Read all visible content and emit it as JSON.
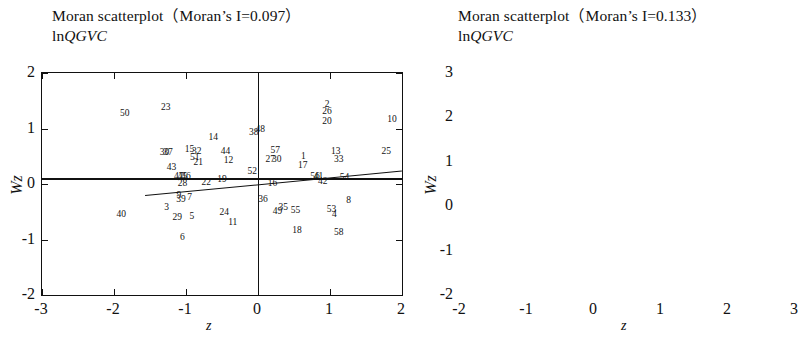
{
  "figure": {
    "kind": "moran-scatterplot-pair",
    "background": "#ffffff",
    "ink": "#111111"
  },
  "panels": [
    {
      "id": "left",
      "title_main": "Moran scatterplot（Moran’s I=0.097）",
      "title_var_prefix": "ln",
      "title_var_italic": "QGVC",
      "xlabel": "z",
      "ylabel": "Wz",
      "xticks": [
        "-3",
        "-2",
        "-1",
        "0",
        "1",
        "2"
      ],
      "yticks": [
        "2",
        "1",
        "0",
        "-1",
        "-2"
      ],
      "xlim": [
        -3,
        2
      ],
      "ylim": [
        -2,
        2
      ]
    },
    {
      "id": "right",
      "title_main": "Moran scatterplot（Moran’s I=0.133）",
      "title_var_prefix": "ln",
      "title_var_italic": "QGVC",
      "xlabel": "z",
      "ylabel": "Wz",
      "xticks": [
        "-2",
        "-1",
        "0",
        "1",
        "2",
        "3"
      ],
      "yticks": [
        "3",
        "2",
        "1",
        "0",
        "-1",
        "-2"
      ],
      "xlim": [
        -2,
        3
      ],
      "ylim": [
        -2,
        3
      ]
    }
  ],
  "chart_data": [
    {
      "type": "scatter",
      "title": "Moran scatterplot（Moran’s I=0.097） lnQGVC",
      "subtitle": "lnQGVC",
      "xlabel": "z",
      "ylabel": "Wz",
      "xlim": [
        -3,
        2
      ],
      "ylim": [
        -2,
        2
      ],
      "grid": false,
      "legend": null,
      "morans_i": 0.097,
      "reference_lines": {
        "vertical_x": 0,
        "horizontal_y": 0.1
      },
      "regression_line": {
        "x_start": -1.57,
        "y_start": -0.2,
        "x_end": 2.0,
        "y_end": 0.24
      },
      "point_label_field": "label",
      "points": [
        {
          "label": "50",
          "x": -1.85,
          "y": 1.26
        },
        {
          "label": "23",
          "x": -1.28,
          "y": 1.37
        },
        {
          "label": "2",
          "x": 0.96,
          "y": 1.42
        },
        {
          "label": "26",
          "x": 0.96,
          "y": 1.3
        },
        {
          "label": "20",
          "x": 0.96,
          "y": 1.12
        },
        {
          "label": "10",
          "x": 1.86,
          "y": 1.15
        },
        {
          "label": "14",
          "x": -0.62,
          "y": 0.82
        },
        {
          "label": "38",
          "x": -0.06,
          "y": 0.92
        },
        {
          "label": "48",
          "x": 0.03,
          "y": 0.97
        },
        {
          "label": "15",
          "x": -0.95,
          "y": 0.62
        },
        {
          "label": "32",
          "x": -0.85,
          "y": 0.58
        },
        {
          "label": "44",
          "x": -0.45,
          "y": 0.58
        },
        {
          "label": "30",
          "x": -1.3,
          "y": 0.55
        },
        {
          "label": "37",
          "x": -1.25,
          "y": 0.55
        },
        {
          "label": "57",
          "x": 0.24,
          "y": 0.59
        },
        {
          "label": "13",
          "x": 1.08,
          "y": 0.58
        },
        {
          "label": "33",
          "x": 1.12,
          "y": 0.43
        },
        {
          "label": "25",
          "x": 1.78,
          "y": 0.58
        },
        {
          "label": "51",
          "x": -0.88,
          "y": 0.47
        },
        {
          "label": "21",
          "x": -0.83,
          "y": 0.38
        },
        {
          "label": "12",
          "x": -0.41,
          "y": 0.42
        },
        {
          "label": "27",
          "x": 0.17,
          "y": 0.44
        },
        {
          "label": "30b",
          "x": 0.26,
          "y": 0.44
        },
        {
          "label": "1",
          "x": 0.63,
          "y": 0.48
        },
        {
          "label": "17",
          "x": 0.62,
          "y": 0.33
        },
        {
          "label": "43",
          "x": -1.2,
          "y": 0.28
        },
        {
          "label": "52",
          "x": -0.08,
          "y": 0.22
        },
        {
          "label": "56",
          "x": 0.79,
          "y": 0.13
        },
        {
          "label": "41",
          "x": 0.84,
          "y": 0.13
        },
        {
          "label": "42",
          "x": 0.9,
          "y": 0.04
        },
        {
          "label": "54",
          "x": 1.2,
          "y": 0.1
        },
        {
          "label": "47",
          "x": -1.1,
          "y": 0.12
        },
        {
          "label": "45",
          "x": -1.05,
          "y": 0.12
        },
        {
          "label": "46",
          "x": -1.0,
          "y": 0.12
        },
        {
          "label": "28",
          "x": -1.05,
          "y": 0.0
        },
        {
          "label": "22",
          "x": -0.72,
          "y": 0.02
        },
        {
          "label": "19",
          "x": -0.5,
          "y": 0.08
        },
        {
          "label": "16",
          "x": 0.2,
          "y": 0.0
        },
        {
          "label": "9",
          "x": -1.1,
          "y": -0.22
        },
        {
          "label": "39",
          "x": -1.07,
          "y": -0.29
        },
        {
          "label": "7",
          "x": -0.95,
          "y": -0.25
        },
        {
          "label": "3",
          "x": -1.27,
          "y": -0.44
        },
        {
          "label": "40",
          "x": -1.9,
          "y": -0.55
        },
        {
          "label": "29",
          "x": -1.12,
          "y": -0.62
        },
        {
          "label": "5",
          "x": -0.92,
          "y": -0.6
        },
        {
          "label": "24",
          "x": -0.47,
          "y": -0.52
        },
        {
          "label": "11",
          "x": -0.35,
          "y": -0.7
        },
        {
          "label": "6",
          "x": -1.05,
          "y": -0.98
        },
        {
          "label": "36",
          "x": 0.07,
          "y": -0.28
        },
        {
          "label": "35",
          "x": 0.35,
          "y": -0.44
        },
        {
          "label": "49",
          "x": 0.27,
          "y": -0.5
        },
        {
          "label": "55",
          "x": 0.52,
          "y": -0.48
        },
        {
          "label": "53",
          "x": 1.02,
          "y": -0.47
        },
        {
          "label": "4",
          "x": 1.06,
          "y": -0.56
        },
        {
          "label": "8",
          "x": 1.26,
          "y": -0.3
        },
        {
          "label": "18",
          "x": 0.54,
          "y": -0.85
        },
        {
          "label": "58",
          "x": 1.12,
          "y": -0.88
        }
      ]
    },
    {
      "type": "scatter",
      "title": "Moran scatterplot（Moran’s I=0.133） lnQGVC",
      "subtitle": "lnQGVC",
      "xlabel": "z",
      "ylabel": "Wz",
      "xlim": [
        -2,
        3
      ],
      "ylim": [
        -2,
        3
      ],
      "grid": false,
      "legend": null,
      "morans_i": 0.133,
      "reference_lines": {
        "vertical_x": 0,
        "horizontal_y": 0.1
      },
      "regression_line": {
        "x_start": -1.25,
        "y_start": -0.13,
        "x_end": 2.6,
        "y_end": 0.38
      },
      "point_label_field": "label",
      "points": [
        {
          "label": "26",
          "x": 1.3,
          "y": 2.45
        },
        {
          "label": "23",
          "x": -0.92,
          "y": 1.58
        },
        {
          "label": "44",
          "x": -0.48,
          "y": 0.92
        },
        {
          "label": "14",
          "x": -0.24,
          "y": 0.93
        },
        {
          "label": "34b",
          "x": -0.38,
          "y": 0.86
        },
        {
          "label": "43",
          "x": -0.33,
          "y": 0.84
        },
        {
          "label": "31",
          "x": -1.32,
          "y": 0.7
        },
        {
          "label": "50",
          "x": -0.72,
          "y": 0.7
        },
        {
          "label": "45",
          "x": -0.66,
          "y": 0.71
        },
        {
          "label": "15",
          "x": -0.58,
          "y": 0.74
        },
        {
          "label": "21",
          "x": -0.1,
          "y": 0.7
        },
        {
          "label": "34",
          "x": -0.52,
          "y": 0.5
        },
        {
          "label": "51",
          "x": -0.22,
          "y": 0.42
        },
        {
          "label": "22",
          "x": -0.12,
          "y": 0.36
        },
        {
          "label": "57",
          "x": 0.26,
          "y": 0.82
        },
        {
          "label": "56",
          "x": 0.3,
          "y": 0.78
        },
        {
          "label": "20",
          "x": 0.18,
          "y": 0.7
        },
        {
          "label": "2",
          "x": 1.02,
          "y": 0.68
        },
        {
          "label": "10",
          "x": 1.18,
          "y": 0.52
        },
        {
          "label": "25",
          "x": 0.38,
          "y": 0.45
        },
        {
          "label": "35",
          "x": 0.04,
          "y": 0.3
        },
        {
          "label": "40",
          "x": 0.1,
          "y": 0.24
        },
        {
          "label": "30",
          "x": 0.13,
          "y": 0.2
        },
        {
          "label": "52",
          "x": 0.36,
          "y": 0.18
        },
        {
          "label": "1",
          "x": 0.62,
          "y": 0.22
        },
        {
          "label": "27",
          "x": 1.02,
          "y": 0.33
        },
        {
          "label": "13",
          "x": 2.26,
          "y": 0.34
        },
        {
          "label": "17",
          "x": 1.14,
          "y": 0.18
        },
        {
          "label": "33",
          "x": 1.22,
          "y": 0.19
        },
        {
          "label": "29",
          "x": -0.95,
          "y": 0.02
        },
        {
          "label": "32",
          "x": -0.72,
          "y": 0.02
        },
        {
          "label": "46",
          "x": -0.26,
          "y": 0.03
        },
        {
          "label": "37",
          "x": -0.12,
          "y": -0.03
        },
        {
          "label": "38",
          "x": 0.03,
          "y": -0.07
        },
        {
          "label": "9",
          "x": 0.08,
          "y": -0.08
        },
        {
          "label": "19",
          "x": 0.13,
          "y": -0.08
        },
        {
          "label": "11",
          "x": 0.22,
          "y": -0.09
        },
        {
          "label": "16",
          "x": 0.38,
          "y": -0.07
        },
        {
          "label": "54",
          "x": 1.24,
          "y": -0.08
        },
        {
          "label": "3",
          "x": -1.22,
          "y": -0.48
        },
        {
          "label": "39",
          "x": -0.92,
          "y": -0.44
        },
        {
          "label": "55",
          "x": -0.72,
          "y": -0.35
        },
        {
          "label": "7",
          "x": -0.58,
          "y": -0.32
        },
        {
          "label": "24",
          "x": -1.07,
          "y": -0.6
        },
        {
          "label": "28",
          "x": -1.07,
          "y": -0.66
        },
        {
          "label": "5",
          "x": -0.92,
          "y": -0.64
        },
        {
          "label": "40b",
          "x": -1.25,
          "y": -0.82
        },
        {
          "label": "6",
          "x": -1.1,
          "y": -0.82
        },
        {
          "label": "36",
          "x": 0.0,
          "y": -0.52
        },
        {
          "label": "53",
          "x": 1.0,
          "y": -0.48
        },
        {
          "label": "42",
          "x": 1.06,
          "y": -0.5
        },
        {
          "label": "4",
          "x": 0.96,
          "y": -0.6
        },
        {
          "label": "41",
          "x": 1.62,
          "y": -0.48
        },
        {
          "label": "49",
          "x": 0.7,
          "y": -0.85
        },
        {
          "label": "18",
          "x": 0.84,
          "y": -0.78
        },
        {
          "label": "58",
          "x": 0.66,
          "y": -0.96
        }
      ]
    }
  ]
}
